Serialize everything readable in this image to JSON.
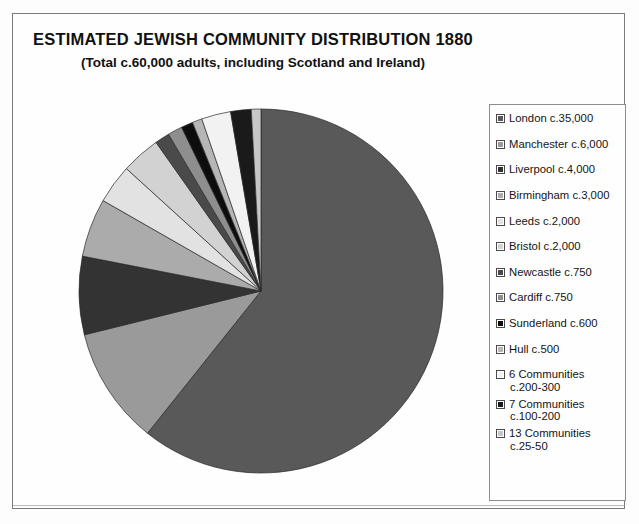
{
  "header": {
    "title": "ESTIMATED JEWISH COMMUNITY DISTRIBUTION 1880",
    "subtitle": "(Total c.60,000 adults, including Scotland and Ireland)"
  },
  "legend": {
    "items": [
      {
        "label": "London c.35,000",
        "color": "#595959",
        "icon": "legend-swatch-london"
      },
      {
        "label": "Manchester c.6,000",
        "color": "#9a9a9a",
        "icon": "legend-swatch-manchester"
      },
      {
        "label": "Liverpool c.4,000",
        "color": "#333333",
        "icon": "legend-swatch-liverpool"
      },
      {
        "label": "Birmingham c.3,000",
        "color": "#ababab",
        "icon": "legend-swatch-birmingham"
      },
      {
        "label": "Leeds c.2,000",
        "color": "#e2e2e2",
        "icon": "legend-swatch-leeds"
      },
      {
        "label": "Bristol c.2,000",
        "color": "#d2d2d2",
        "icon": "legend-swatch-bristol"
      },
      {
        "label": "Newcastle c.750",
        "color": "#4a4a4a",
        "icon": "legend-swatch-newcastle"
      },
      {
        "label": "Cardiff c.750",
        "color": "#8e8e8e",
        "icon": "legend-swatch-cardiff"
      },
      {
        "label": "Sunderland c.600",
        "color": "#0d0d0d",
        "icon": "legend-swatch-sunderland"
      },
      {
        "label": "Hull c.500",
        "color": "#b6b6b6",
        "icon": "legend-swatch-hull"
      },
      {
        "label": "6 Communities",
        "sub": "c.200-300",
        "color": "#f2f2f2",
        "icon": "legend-swatch-6-communities"
      },
      {
        "label": "7 Communities",
        "sub": "c.100-200",
        "color": "#1a1a1a",
        "icon": "legend-swatch-7-communities"
      },
      {
        "label": "13 Communities",
        "sub": "c.25-50",
        "color": "#c7c7c7",
        "icon": "legend-swatch-13-communities"
      }
    ]
  },
  "chart_data": {
    "type": "pie",
    "title": "ESTIMATED JEWISH COMMUNITY DISTRIBUTION 1880",
    "subtitle": "(Total c.60,000 adults, including Scotland and Ireland)",
    "total": 60000,
    "start_angle": 0,
    "direction": "clockwise",
    "legend_position": "right",
    "labels": [
      "London c.35,000",
      "Manchester c.6,000",
      "Liverpool c.4,000",
      "Birmingham c.3,000",
      "Leeds c.2,000",
      "Bristol c.2,000",
      "Newcastle c.750",
      "Cardiff c.750",
      "Sunderland c.600",
      "Hull c.500",
      "6 Communities c.200-300",
      "7 Communities c.100-200",
      "13 Communities c.25-50"
    ],
    "values": [
      35000,
      6000,
      4000,
      3000,
      2000,
      2000,
      750,
      750,
      600,
      500,
      1500,
      1050,
      490
    ],
    "colors": [
      "#595959",
      "#9a9a9a",
      "#333333",
      "#ababab",
      "#e2e2e2",
      "#d2d2d2",
      "#4a4a4a",
      "#8e8e8e",
      "#0d0d0d",
      "#b6b6b6",
      "#f2f2f2",
      "#1a1a1a",
      "#c7c7c7"
    ]
  }
}
